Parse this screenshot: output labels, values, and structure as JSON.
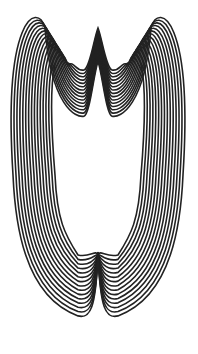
{
  "figure": {
    "stroke_color": "#222222",
    "background": "#ffffff",
    "curve_count": 15,
    "stroke_width": 1.6,
    "spacing": 3.0,
    "innermost": {
      "left_x": 55,
      "right_x": 140,
      "lobe_top_y": 70,
      "notch_y": 55,
      "waist_y": 175,
      "bottom_y": 250,
      "cusp_y": 250
    }
  }
}
